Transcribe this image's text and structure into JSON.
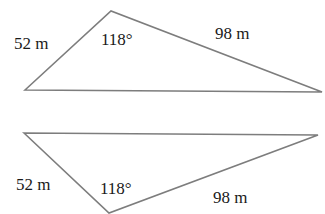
{
  "figures": [
    {
      "id": "triangle-top",
      "vertices": {
        "left": [
          25,
          90
        ],
        "apex": [
          111,
          11
        ],
        "right": [
          322,
          92
        ]
      },
      "labels": {
        "side_short": "52 m",
        "angle": "118°",
        "side_long": "98 m"
      }
    },
    {
      "id": "triangle-bottom",
      "vertices": {
        "left": [
          24,
          133
        ],
        "apex": [
          109,
          213
        ],
        "right": [
          318,
          135
        ]
      },
      "labels": {
        "side_short": "52 m",
        "angle": "118°",
        "side_long": "98 m"
      }
    }
  ],
  "colors": {
    "stroke": "#7d7d7d",
    "text": "#1a1a1a",
    "background": "#ffffff"
  }
}
